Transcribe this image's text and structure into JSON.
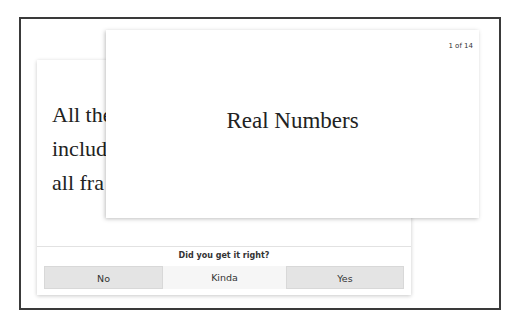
{
  "flashcard_deck": {
    "back_card": {
      "definition_lines": [
        "All the",
        "includ",
        "all fra"
      ]
    },
    "front_card": {
      "counter": "1 of 14",
      "term": "Real Numbers"
    },
    "feedback": {
      "question": "Did you get it right?",
      "buttons": {
        "no": "No",
        "kinda": "Kinda",
        "yes": "Yes"
      }
    }
  }
}
